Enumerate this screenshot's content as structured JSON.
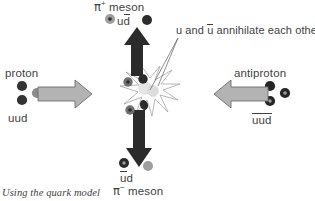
{
  "diagram": {
    "title_caption": "Using the quark model",
    "left_particle": {
      "name": "proton",
      "quark_content": "uud",
      "quarks": [
        {
          "flavor": "u",
          "type": "quark",
          "color": "#333333"
        },
        {
          "flavor": "u",
          "type": "quark",
          "color": "#333333"
        },
        {
          "flavor": "d",
          "type": "quark",
          "color": "#8c8c8c"
        }
      ],
      "arrow_direction": "right"
    },
    "right_particle": {
      "name": "antiproton",
      "quark_content": "uud",
      "quark_content_overline": true,
      "quarks": [
        {
          "flavor": "u-bar",
          "type": "antiquark",
          "color": "#262626"
        },
        {
          "flavor": "u-bar",
          "type": "antiquark",
          "color": "#262626"
        },
        {
          "flavor": "d-bar",
          "type": "antiquark",
          "color": "#262626"
        }
      ],
      "arrow_direction": "left"
    },
    "top_product": {
      "name_pi": "π",
      "charge": "+",
      "name_suffix": " meson",
      "quark_left": "u",
      "quark_right": "d",
      "quark_right_overline": true,
      "arrow_direction": "up"
    },
    "bottom_product": {
      "name_pi": "π",
      "charge": "−",
      "name_suffix": " meson",
      "quark_left": "u",
      "quark_left_overline": true,
      "quark_right": "d",
      "arrow_direction": "down"
    },
    "annotation": {
      "text_before": "u and ",
      "text_bar": "u",
      "text_after": " annihilate each other",
      "leader_line": true
    },
    "colors": {
      "quark_dark": "#333333",
      "quark_gray": "#8c8c8c",
      "arrow_fill": "#b3b3b3",
      "arrow_stroke": "#6e6e6e",
      "black_arrow": "#2b2b2b",
      "burst_stroke": "#8f8f8f",
      "annihilation_glow": "#e2e2e2",
      "text": "#3f3f3f",
      "background": "#ffffff"
    }
  }
}
